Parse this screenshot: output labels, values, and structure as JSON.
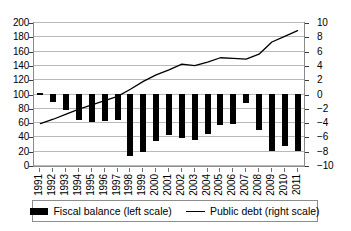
{
  "chart_data": {
    "type": "bar",
    "title": "",
    "subtitle": "",
    "xlabel": "",
    "ylabel": "",
    "grid": true,
    "legend_position": "bottom",
    "categories": [
      "1991",
      "1992",
      "1993",
      "1994",
      "1995",
      "1996",
      "1997",
      "1998",
      "1999",
      "2000",
      "2001",
      "2002",
      "2003",
      "2004",
      "2005",
      "2006",
      "2007",
      "2008",
      "2009",
      "2010",
      "2011"
    ],
    "left_axis": {
      "label": "",
      "ylim": [
        0,
        200
      ],
      "step": 20,
      "ticks": [
        "0",
        "20",
        "40",
        "60",
        "80",
        "100",
        "120",
        "140",
        "160",
        "180",
        "200"
      ]
    },
    "right_axis": {
      "label": "",
      "ylim": [
        -10,
        10
      ],
      "step": 2,
      "ticks": [
        "-10",
        "-8",
        "-6",
        "-4",
        "-2",
        "0",
        "2",
        "4",
        "6",
        "8",
        "10"
      ]
    },
    "series": [
      {
        "name": "Fiscal balance (left scale)",
        "type": "bar",
        "axis": "right",
        "color": "#000000",
        "values": [
          0.0,
          -1.1,
          -2.3,
          -3.7,
          -3.9,
          -3.8,
          -3.6,
          -8.7,
          -8.1,
          -6.6,
          -5.8,
          -6.2,
          -6.5,
          -5.6,
          -4.3,
          -4.2,
          -1.2,
          -5.1,
          -8.0,
          -7.3,
          -8.0
        ]
      },
      {
        "name": "Public debt (right scale)",
        "type": "line",
        "axis": "left",
        "color": "#000000",
        "values": [
          58,
          64,
          71,
          78,
          84,
          90,
          96,
          106,
          117,
          126,
          133,
          141,
          139,
          144,
          150,
          149,
          148,
          155,
          172,
          180,
          188
        ]
      }
    ]
  },
  "legend": {
    "entries": [
      {
        "label": "Fiscal balance (left scale)",
        "marker": "bar-marker"
      },
      {
        "label": "Public debt (right scale)",
        "marker": "line-marker"
      }
    ]
  }
}
